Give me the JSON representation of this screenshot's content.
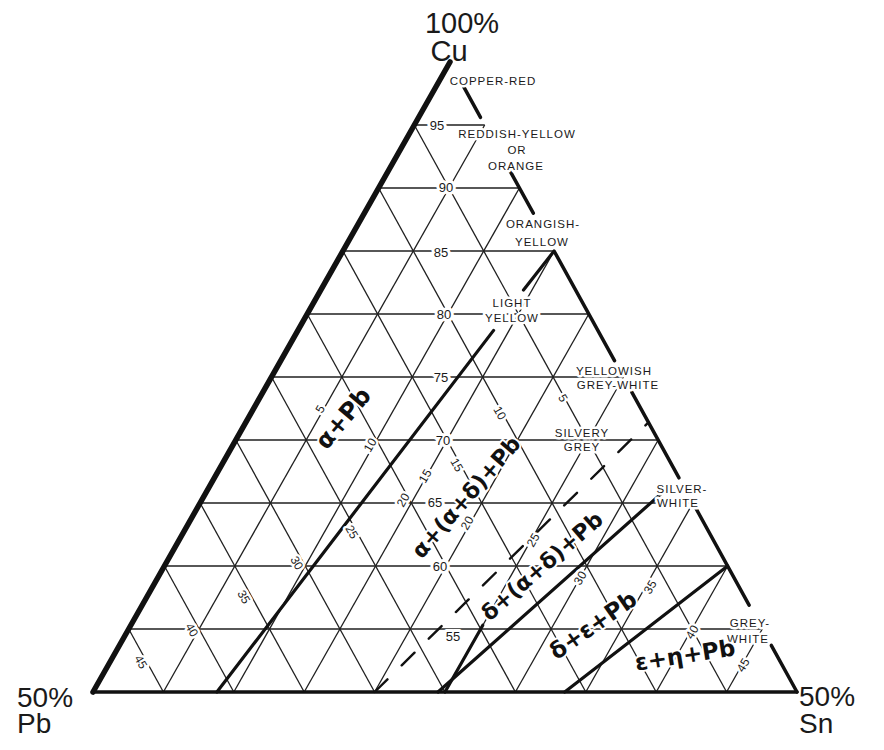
{
  "diagram": {
    "type": "ternary",
    "system": "Cu-Pb-Sn",
    "coord_order": [
      "Cu",
      "Pb",
      "Sn"
    ],
    "vertices": {
      "top": {
        "percent": "100%",
        "element": "Cu"
      },
      "left": {
        "percent": "50%",
        "element": "Pb"
      },
      "right": {
        "percent": "50%",
        "element": "Sn"
      }
    },
    "grid": {
      "cu_lines": [
        95,
        90,
        85,
        80,
        75,
        70,
        65,
        60,
        55
      ],
      "pb_lines": [
        5,
        10,
        15,
        20,
        25,
        30,
        35,
        40,
        45
      ],
      "sn_lines": [
        5,
        10,
        15,
        20,
        25,
        30,
        35,
        40,
        45
      ]
    },
    "cu_ticks": [
      "95",
      "90",
      "85",
      "80",
      "75",
      "70",
      "65",
      "60",
      "55"
    ],
    "pb_ticks": [
      "5",
      "10",
      "15",
      "20",
      "25",
      "30",
      "35",
      "40",
      "45"
    ],
    "sn_ticks": [
      "5",
      "10",
      "15",
      "20",
      "25",
      "30",
      "35",
      "40",
      "45"
    ],
    "color_zones": [
      {
        "lines": [
          "COPPER-RED"
        ]
      },
      {
        "lines": [
          "REDDISH-YELLOW",
          "OR",
          "ORANGE"
        ]
      },
      {
        "lines": [
          "ORANGISH-",
          "YELLOW"
        ]
      },
      {
        "lines": [
          "LIGHT",
          "YELLOW"
        ]
      },
      {
        "lines": [
          "YELLOWISH",
          "GREY-WHITE"
        ]
      },
      {
        "lines": [
          "SILVERY",
          "GREY"
        ]
      },
      {
        "lines": [
          "SILVER-",
          "WHITE"
        ]
      },
      {
        "lines": [
          "GREY-",
          "WHITE"
        ]
      }
    ],
    "right_edge_segments_cu": [
      [
        98,
        95.6
      ],
      [
        91.4,
        88
      ],
      [
        84.9,
        76.3
      ],
      [
        73.8,
        67
      ],
      [
        64.6,
        56.9
      ],
      [
        53.7,
        50
      ]
    ],
    "phase_regions": [
      {
        "label": "α+Pb"
      },
      {
        "label": "α+(α+δ)+Pb"
      },
      {
        "label": "δ+(α+δ)+Pb"
      },
      {
        "label": "δ+ε+Pb"
      },
      {
        "label": "ε+η+Pb"
      }
    ],
    "phase_boundaries": [
      {
        "name": "alpha-pb-boundary",
        "style": "solid",
        "segments": [
          [
            [
              50,
              41.2,
              8.8
            ],
            [
              78.7,
              7.4,
              13.9
            ]
          ],
          [
            [
              81.9,
              3.7,
              14.4
            ],
            [
              85,
              0,
              15
            ]
          ]
        ]
      },
      {
        "name": "alpha-delta-dashed-boundary",
        "style": "dashed",
        "segments": [
          [
            [
              50,
              30,
              20
            ],
            [
              71.4,
              0,
              28.6
            ]
          ]
        ]
      },
      {
        "name": "delta-epsilon-boundary",
        "style": "solid",
        "segments": [
          [
            [
              50,
              25.5,
              24.5
            ],
            [
              66.2,
              1.2,
              32.6
            ]
          ]
        ]
      },
      {
        "name": "delta-short-boundary",
        "style": "solid",
        "segments": [
          [
            [
              50,
              25,
              25
            ],
            [
              55.3,
              19.7,
              25
            ]
          ]
        ]
      },
      {
        "name": "epsilon-eta-boundary",
        "style": "solid",
        "segments": [
          [
            [
              50,
              16.5,
              33.5
            ],
            [
              60,
              0,
              40
            ]
          ]
        ]
      }
    ]
  }
}
